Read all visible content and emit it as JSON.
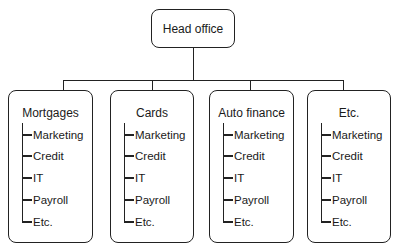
{
  "diagram": {
    "type": "org-chart",
    "root": {
      "label": "Head office"
    },
    "units": [
      {
        "label": "Mortgages",
        "items": [
          "Marketing",
          "Credit",
          "IT",
          "Payroll",
          "Etc."
        ]
      },
      {
        "label": "Cards",
        "items": [
          "Marketing",
          "Credit",
          "IT",
          "Payroll",
          "Etc."
        ]
      },
      {
        "label": "Auto finance",
        "items": [
          "Marketing",
          "Credit",
          "IT",
          "Payroll",
          "Etc."
        ]
      },
      {
        "label": "Etc.",
        "items": [
          "Marketing",
          "Credit",
          "IT",
          "Payroll",
          "Etc."
        ]
      }
    ],
    "colors": {
      "line": "#222222",
      "background": "#ffffff",
      "text": "#1a1a1a"
    }
  }
}
